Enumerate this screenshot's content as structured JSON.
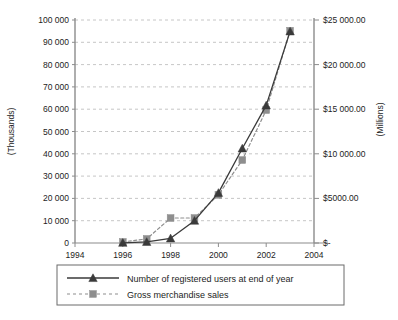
{
  "chart_data": {
    "type": "line",
    "title": "",
    "xlabel": "",
    "ylabel": "(Thousands)",
    "y2label": "(Millions)",
    "xlim": [
      1994,
      2004
    ],
    "ylim": [
      0,
      100000
    ],
    "y2lim": [
      0,
      25000
    ],
    "grid": true,
    "legend_position": "bottom",
    "x_ticks": [
      "1994",
      "1996",
      "1998",
      "2000",
      "2002",
      "2004"
    ],
    "x_tick_values": [
      1994,
      1996,
      1998,
      2000,
      2002,
      2004
    ],
    "y_ticks": [
      "0",
      "10 000",
      "20 000",
      "30 000",
      "40 000",
      "50 000",
      "60 000",
      "70 000",
      "80 000",
      "90 000",
      "100 000"
    ],
    "y_tick_values": [
      0,
      10000,
      20000,
      30000,
      40000,
      50000,
      60000,
      70000,
      80000,
      90000,
      100000
    ],
    "y2_ticks": [
      "$-",
      "$5000.00",
      "$10 000.00",
      "$15 000.00",
      "$20 000.00",
      "$25 000.00"
    ],
    "y2_tick_values": [
      0,
      5000,
      10000,
      15000,
      20000,
      25000
    ],
    "x": [
      1996,
      1997,
      1998,
      1999,
      2000,
      2001,
      2002,
      2003
    ],
    "series": [
      {
        "name": "Number of registered users at end of year",
        "axis": "left",
        "marker": "triangle",
        "line_style": "solid",
        "color": "#3a3a3a",
        "values": [
          100,
          500,
          2100,
          10000,
          22500,
          42400,
          61700,
          94900
        ]
      },
      {
        "name": "Gross merchandise sales",
        "axis": "right",
        "marker": "square",
        "line_style": "dashed",
        "color": "#8e8e8e",
        "values": [
          120,
          460,
          2800,
          2800,
          5400,
          9300,
          14900,
          23800
        ]
      }
    ],
    "legend": [
      {
        "label": "Number of registered users at end of year",
        "marker": "triangle",
        "line_style": "solid",
        "color": "#3a3a3a"
      },
      {
        "label": "Gross merchandise sales",
        "marker": "square",
        "line_style": "dashed",
        "color": "#8e8e8e"
      }
    ],
    "colors": {
      "series_users": "#3a3a3a",
      "series_sales": "#8e8e8e",
      "grid": "#b8b8b8",
      "axis": "#8c8c8c",
      "background": "#ffffff",
      "text": "#1d1d1d"
    }
  }
}
